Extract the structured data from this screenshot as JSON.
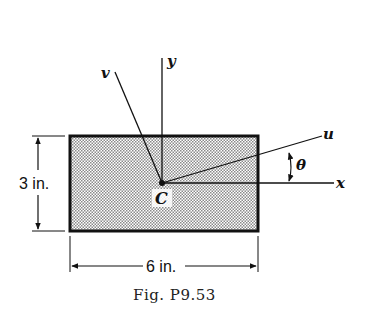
{
  "figure": {
    "caption_prefix": "Fig.",
    "caption_number": "P9.53",
    "caption": "Fig. P9.53"
  },
  "labels": {
    "y_axis": "y",
    "x_axis": "x",
    "u_axis": "u",
    "v_axis": "v",
    "angle": "θ",
    "centroid": "C"
  },
  "dimensions": {
    "height": "3 in.",
    "width": "6 in."
  },
  "colors": {
    "ink": "#111111",
    "fill_dots": "#9a9a9a",
    "background": "#ffffff"
  }
}
